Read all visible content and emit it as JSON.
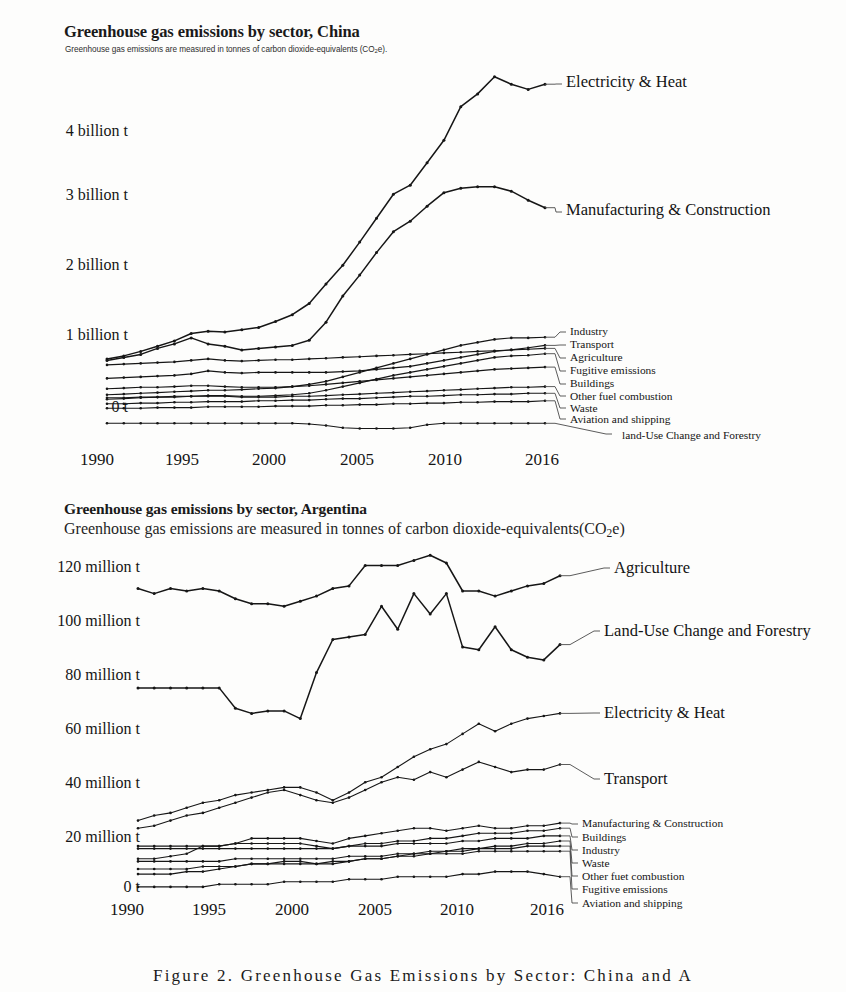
{
  "document": {
    "caption": "Figure 2.  Greenhouse Gas Emissions by Sector: China and A"
  },
  "charts": [
    {
      "id": "china",
      "title": "Greenhouse gas emissions by sector, China",
      "subtitle_prefix": "Greenhouse gas emissions are measured in tonnes of carbon dioxide-equivalents (CO",
      "subtitle_sub": "2",
      "subtitle_suffix": "e).",
      "y_ticks": [
        "4 billion t",
        "3 billion t",
        "2 billion t",
        "1 billion t",
        "0 t"
      ],
      "x_ticks": [
        "1990",
        "1995",
        "2000",
        "2005",
        "2010",
        "2016"
      ],
      "series_labels": [
        "Electricity & Heat",
        "Manufacturing & Construction",
        "Industry",
        "Transport",
        "Agriculture",
        "Fugitive emissions",
        "Buildings",
        "Other fuel combustion",
        "Waste",
        "Aviation and shipping",
        "land-Use Change and Forestry"
      ]
    },
    {
      "id": "argentina",
      "title": "Greenhouse gas emissions by sector, Argentina",
      "subtitle_prefix": "Greenhouse gas emissions are measured in tonnes of carbon dioxide-equivalents(CO",
      "subtitle_sub": "2",
      "subtitle_suffix": "e)",
      "y_ticks": [
        "120 million t",
        "100 million t",
        "80 million t",
        "60 million t",
        "40 million t",
        "20 million t",
        "0 t"
      ],
      "x_ticks": [
        "1990",
        "1995",
        "2000",
        "2005",
        "2010",
        "2016"
      ],
      "series_labels": [
        "Agriculture",
        "Land-Use Change and Forestry",
        "Electricity & Heat",
        "Transport",
        "Manufacturing & Construction",
        "Buildings",
        "Industry",
        "Waste",
        "Other fuet combustion",
        "Fugitive emissions",
        "Aviation and shipping"
      ]
    }
  ],
  "chart_data": [
    {
      "type": "line",
      "title": "Greenhouse gas emissions by sector, China",
      "subtitle": "Greenhouse gas emissions are measured in tonnes of carbon dioxide-equivalents (CO2e).",
      "xlabel": "",
      "ylabel": "",
      "unit": "tonnes CO2e",
      "x": [
        1990,
        1991,
        1992,
        1993,
        1994,
        1995,
        1996,
        1997,
        1998,
        1999,
        2000,
        2001,
        2002,
        2003,
        2004,
        2005,
        2006,
        2007,
        2008,
        2009,
        2010,
        2011,
        2012,
        2013,
        2014,
        2015,
        2016
      ],
      "xlim": [
        1990,
        2016
      ],
      "ylim": [
        -0.35,
        4.7
      ],
      "y_tick_values": [
        0,
        1,
        2,
        3,
        4
      ],
      "y_tick_labels": [
        "0 t",
        "1 billion t",
        "2 billion t",
        "3 billion t",
        "4 billion t"
      ],
      "x_tick_values": [
        1990,
        1995,
        2000,
        2005,
        2010,
        2016
      ],
      "grid": false,
      "legend": "right-inline-labels",
      "series": [
        {
          "name": "Electricity & Heat",
          "values": [
            0.68,
            0.72,
            0.78,
            0.85,
            0.92,
            1.02,
            1.05,
            1.04,
            1.07,
            1.1,
            1.18,
            1.27,
            1.42,
            1.68,
            1.93,
            2.24,
            2.56,
            2.88,
            3.0,
            3.3,
            3.6,
            4.05,
            4.22,
            4.45,
            4.35,
            4.28,
            4.35
          ]
        },
        {
          "name": "Manufacturing & Construction",
          "values": [
            0.66,
            0.7,
            0.74,
            0.82,
            0.88,
            0.96,
            0.88,
            0.85,
            0.8,
            0.82,
            0.84,
            0.86,
            0.93,
            1.17,
            1.52,
            1.8,
            2.1,
            2.38,
            2.52,
            2.72,
            2.9,
            2.96,
            2.98,
            2.98,
            2.92,
            2.8,
            2.7
          ]
        },
        {
          "name": "Industry",
          "values": [
            0.2,
            0.21,
            0.22,
            0.23,
            0.24,
            0.25,
            0.26,
            0.26,
            0.27,
            0.28,
            0.29,
            0.31,
            0.34,
            0.38,
            0.44,
            0.5,
            0.56,
            0.62,
            0.68,
            0.74,
            0.8,
            0.86,
            0.9,
            0.94,
            0.96,
            0.96,
            0.97
          ]
        },
        {
          "name": "Transport",
          "values": [
            0.42,
            0.43,
            0.44,
            0.45,
            0.46,
            0.48,
            0.52,
            0.5,
            0.49,
            0.5,
            0.5,
            0.5,
            0.5,
            0.5,
            0.51,
            0.52,
            0.54,
            0.56,
            0.58,
            0.62,
            0.66,
            0.7,
            0.74,
            0.78,
            0.8,
            0.83,
            0.86
          ]
        },
        {
          "name": "Agriculture",
          "values": [
            0.6,
            0.61,
            0.62,
            0.63,
            0.64,
            0.66,
            0.68,
            0.66,
            0.65,
            0.66,
            0.67,
            0.67,
            0.68,
            0.69,
            0.7,
            0.71,
            0.72,
            0.73,
            0.74,
            0.75,
            0.76,
            0.77,
            0.78,
            0.79,
            0.8,
            0.81,
            0.82
          ]
        },
        {
          "name": "Fugitive emissions",
          "values": [
            0.14,
            0.15,
            0.16,
            0.17,
            0.17,
            0.18,
            0.19,
            0.19,
            0.18,
            0.18,
            0.19,
            0.2,
            0.22,
            0.26,
            0.31,
            0.36,
            0.41,
            0.46,
            0.5,
            0.54,
            0.58,
            0.62,
            0.66,
            0.7,
            0.72,
            0.73,
            0.75
          ]
        },
        {
          "name": "Buildings",
          "values": [
            0.28,
            0.29,
            0.3,
            0.3,
            0.31,
            0.32,
            0.32,
            0.31,
            0.3,
            0.3,
            0.3,
            0.31,
            0.32,
            0.34,
            0.36,
            0.38,
            0.4,
            0.42,
            0.44,
            0.46,
            0.48,
            0.5,
            0.52,
            0.54,
            0.55,
            0.56,
            0.57
          ]
        },
        {
          "name": "Other fuel combustion",
          "values": [
            0.16,
            0.16,
            0.17,
            0.17,
            0.18,
            0.18,
            0.18,
            0.18,
            0.17,
            0.17,
            0.17,
            0.18,
            0.18,
            0.19,
            0.2,
            0.21,
            0.22,
            0.23,
            0.24,
            0.25,
            0.26,
            0.27,
            0.28,
            0.29,
            0.3,
            0.3,
            0.31
          ]
        },
        {
          "name": "Waste",
          "values": [
            0.08,
            0.08,
            0.09,
            0.09,
            0.1,
            0.1,
            0.11,
            0.11,
            0.11,
            0.12,
            0.12,
            0.13,
            0.13,
            0.14,
            0.15,
            0.15,
            0.16,
            0.17,
            0.18,
            0.18,
            0.19,
            0.2,
            0.2,
            0.21,
            0.21,
            0.22,
            0.22
          ]
        },
        {
          "name": "Aviation and shipping",
          "values": [
            0.02,
            0.02,
            0.02,
            0.03,
            0.03,
            0.03,
            0.04,
            0.04,
            0.04,
            0.04,
            0.05,
            0.05,
            0.05,
            0.06,
            0.06,
            0.07,
            0.07,
            0.08,
            0.08,
            0.09,
            0.09,
            0.1,
            0.1,
            0.11,
            0.11,
            0.11,
            0.12
          ]
        },
        {
          "name": "land-Use Change and Forestry",
          "values": [
            -0.18,
            -0.18,
            -0.18,
            -0.18,
            -0.18,
            -0.18,
            -0.18,
            -0.18,
            -0.18,
            -0.18,
            -0.18,
            -0.18,
            -0.19,
            -0.21,
            -0.24,
            -0.25,
            -0.25,
            -0.25,
            -0.24,
            -0.2,
            -0.18,
            -0.18,
            -0.18,
            -0.18,
            -0.18,
            -0.18,
            -0.18
          ]
        }
      ]
    },
    {
      "type": "line",
      "title": "Greenhouse gas emissions by sector, Argentina",
      "subtitle": "Greenhouse gas emissions are measured in tonnes of carbon dioxide-equivalents(CO2e)",
      "xlabel": "",
      "ylabel": "",
      "unit": "tonnes CO2e",
      "x": [
        1990,
        1991,
        1992,
        1993,
        1994,
        1995,
        1996,
        1997,
        1998,
        1999,
        2000,
        2001,
        2002,
        2003,
        2004,
        2005,
        2006,
        2007,
        2008,
        2009,
        2010,
        2011,
        2012,
        2013,
        2014,
        2015,
        2016
      ],
      "xlim": [
        1990,
        2016
      ],
      "ylim": [
        0,
        138
      ],
      "y_tick_values": [
        0,
        20,
        40,
        60,
        80,
        100,
        120
      ],
      "y_tick_labels": [
        "0 t",
        "20 million t",
        "40 million t",
        "60 million t",
        "80 million t",
        "100 million t",
        "120 million t"
      ],
      "x_tick_values": [
        1990,
        1995,
        2000,
        2005,
        2010,
        2016
      ],
      "grid": false,
      "legend": "right-inline-labels",
      "series": [
        {
          "name": "Agriculture",
          "values": [
            119,
            117,
            119,
            118,
            119,
            118,
            115,
            113,
            113,
            112,
            114,
            116,
            119,
            120,
            128,
            128,
            128,
            130,
            132,
            129,
            118,
            118,
            116,
            118,
            120,
            121,
            124
          ]
        },
        {
          "name": "Land-Use Change and Forestry",
          "values": [
            80,
            80,
            80,
            80,
            80,
            80,
            72,
            70,
            71,
            71,
            68,
            86,
            99,
            100,
            101,
            112,
            103,
            117,
            109,
            117,
            96,
            95,
            104,
            95,
            92,
            91,
            97
          ]
        },
        {
          "name": "Electricity & Heat",
          "values": [
            28,
            30,
            31,
            33,
            35,
            36,
            38,
            39,
            40,
            41,
            41,
            39,
            36,
            39,
            43,
            45,
            49,
            53,
            56,
            58,
            62,
            66,
            63,
            66,
            68,
            69,
            70
          ]
        },
        {
          "name": "Transport",
          "values": [
            25,
            26,
            28,
            30,
            31,
            33,
            35,
            37,
            39,
            40,
            38,
            36,
            35,
            37,
            40,
            43,
            45,
            44,
            47,
            45,
            48,
            51,
            49,
            47,
            48,
            48,
            50
          ]
        },
        {
          "name": "Manufacturing & Construction",
          "values": [
            13,
            13,
            14,
            15,
            18,
            18,
            19,
            21,
            21,
            21,
            21,
            20,
            19,
            21,
            22,
            23,
            24,
            25,
            25,
            24,
            25,
            26,
            25,
            25,
            26,
            26,
            27
          ]
        },
        {
          "name": "Buildings",
          "values": [
            18,
            18,
            18,
            18,
            18,
            18,
            19,
            19,
            19,
            19,
            19,
            18,
            17,
            18,
            19,
            19,
            20,
            20,
            21,
            21,
            22,
            23,
            23,
            23,
            24,
            24,
            25
          ]
        },
        {
          "name": "Industry",
          "values": [
            17,
            17,
            17,
            17,
            17,
            17,
            17,
            17,
            17,
            17,
            17,
            17,
            17,
            18,
            18,
            18,
            19,
            19,
            19,
            19,
            20,
            20,
            21,
            21,
            21,
            22,
            22
          ]
        },
        {
          "name": "Waste",
          "values": [
            12,
            12,
            12,
            12,
            12,
            12,
            13,
            13,
            13,
            13,
            13,
            13,
            13,
            14,
            14,
            14,
            15,
            15,
            16,
            16,
            17,
            17,
            18,
            18,
            19,
            19,
            20
          ]
        },
        {
          "name": "Other fuet combustion",
          "values": [
            9,
            9,
            9,
            9,
            10,
            10,
            10,
            11,
            11,
            11,
            11,
            11,
            12,
            12,
            13,
            13,
            14,
            15,
            15,
            16,
            16,
            17,
            17,
            17,
            18,
            18,
            18
          ]
        },
        {
          "name": "Fugitive emissions",
          "values": [
            7,
            7,
            7,
            8,
            8,
            9,
            10,
            11,
            11,
            12,
            12,
            11,
            11,
            12,
            13,
            13,
            14,
            14,
            15,
            15,
            15,
            16,
            16,
            16,
            16,
            16,
            16
          ]
        },
        {
          "name": "Aviation and shipping",
          "values": [
            2,
            2,
            2,
            2,
            2,
            3,
            3,
            3,
            3,
            4,
            4,
            4,
            4,
            5,
            5,
            5,
            6,
            6,
            6,
            6,
            7,
            7,
            8,
            8,
            8,
            7,
            6
          ]
        }
      ]
    }
  ]
}
